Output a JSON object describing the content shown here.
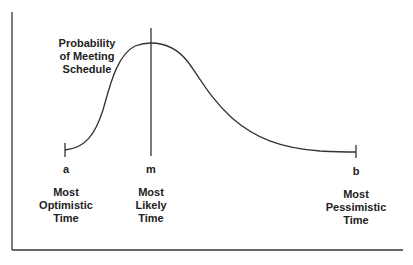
{
  "diagram": {
    "title_lines": [
      "Probability",
      "of Meeting",
      "Schedule"
    ],
    "points": [
      {
        "id": "a",
        "letter": "a",
        "label_lines": [
          "Most",
          "Optimistic",
          "Time"
        ]
      },
      {
        "id": "m",
        "letter": "m",
        "label_lines": [
          "Most",
          "Likely",
          "Time"
        ]
      },
      {
        "id": "b",
        "letter": "b",
        "label_lines": [
          "Most",
          "Pessimistic",
          "Time"
        ]
      }
    ],
    "colors": {
      "line": "#333333",
      "text": "#222222",
      "background": "#ffffff"
    }
  }
}
